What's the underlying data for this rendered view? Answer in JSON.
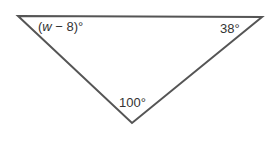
{
  "diagram": {
    "type": "triangle",
    "vertices": {
      "top_left": {
        "x": 18,
        "y": 16
      },
      "top_right": {
        "x": 262,
        "y": 17
      },
      "bottom": {
        "x": 132,
        "y": 123
      }
    },
    "stroke_color": "#555555",
    "angles": {
      "top_left": {
        "prefix": "(",
        "variable": "w",
        "suffix": " − 8)°"
      },
      "top_right": {
        "label": "38°"
      },
      "bottom": {
        "label": "100°"
      }
    }
  }
}
